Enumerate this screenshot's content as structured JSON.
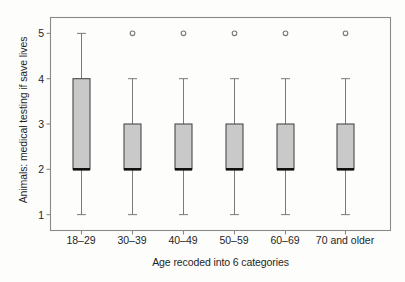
{
  "chart_data": {
    "type": "box",
    "title": "",
    "xlabel": "Age recoded into 6 categories",
    "ylabel": "Animals: medical testing if save lives",
    "ylim": [
      0.65,
      5.35
    ],
    "yticks": [
      1,
      2,
      3,
      4,
      5
    ],
    "ytick_labels": [
      "1",
      "2",
      "3",
      "4",
      "5"
    ],
    "grid": false,
    "legend": null,
    "categories": [
      "18–29",
      "30–39",
      "40–49",
      "50–59",
      "60–69",
      "70 and older"
    ],
    "boxes": [
      {
        "category": "18–29",
        "whisker_low": 1,
        "q1": 2,
        "median": 2,
        "q3": 4,
        "whisker_high": 5,
        "outliers": []
      },
      {
        "category": "30–39",
        "whisker_low": 1,
        "q1": 2,
        "median": 2,
        "q3": 3,
        "whisker_high": 4,
        "outliers": [
          5
        ]
      },
      {
        "category": "40–49",
        "whisker_low": 1,
        "q1": 2,
        "median": 2,
        "q3": 3,
        "whisker_high": 4,
        "outliers": [
          5
        ]
      },
      {
        "category": "50–59",
        "whisker_low": 1,
        "q1": 2,
        "median": 2,
        "q3": 3,
        "whisker_high": 4,
        "outliers": [
          5
        ]
      },
      {
        "category": "60–69",
        "whisker_low": 1,
        "q1": 2,
        "median": 2,
        "q3": 3,
        "whisker_high": 4,
        "outliers": [
          5
        ]
      },
      {
        "category": "70 and older",
        "whisker_low": 1,
        "q1": 2,
        "median": 2,
        "q3": 3,
        "whisker_high": 4,
        "outliers": [
          5
        ]
      }
    ],
    "colors": {
      "box_fill": "#c9c9c9",
      "box_edge": "#4a4a4a",
      "median": "#111111",
      "whisker": "#7a7a7a",
      "outlier_edge": "#7a7a7a",
      "frame": "#8a8a8a",
      "background": "#fdfdfc",
      "text": "#1f1f1f"
    }
  }
}
